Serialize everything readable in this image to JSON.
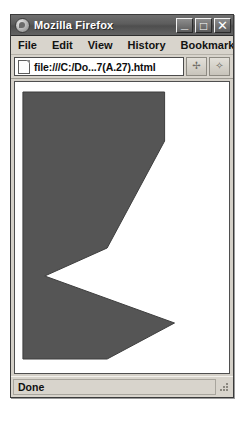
{
  "window": {
    "title": "Mozilla Firefox",
    "icon": "firefox-icon",
    "controls": {
      "minimize": "_",
      "maximize": "□",
      "close": "✕"
    }
  },
  "menubar": {
    "items": [
      {
        "label": "File",
        "accel": "F"
      },
      {
        "label": "Edit",
        "accel": "E"
      },
      {
        "label": "View",
        "accel": "V"
      },
      {
        "label": "History",
        "accel": "s"
      },
      {
        "label": "Bookmarks",
        "accel": "B"
      },
      {
        "label": "To",
        "accel": "T"
      }
    ]
  },
  "navbar": {
    "page_icon": "document-icon",
    "url": "file:///C:/Do...7(A.27).html",
    "url_placeholder": "Go to a Website",
    "buttons": [
      {
        "name": "go-button",
        "glyph": "✢"
      },
      {
        "name": "dropdown-button",
        "glyph": "✧"
      }
    ]
  },
  "statusbar": {
    "text": "Done",
    "grip": "resize-grip"
  },
  "chart_data": {
    "type": "polygon",
    "title": "",
    "background": "#ffffff",
    "fill": "#555555",
    "stroke": "#3d3d3d",
    "viewbox": [
      0,
      0,
      216,
      291
    ],
    "points": [
      [
        8,
        10
      ],
      [
        151,
        10
      ],
      [
        151,
        59
      ],
      [
        93,
        166
      ],
      [
        30,
        194
      ],
      [
        161,
        241
      ],
      [
        93,
        277
      ],
      [
        8,
        277
      ]
    ],
    "points_string": "8,10 151,10 151,59 93,166 30,194 161,241 93,277 8,277",
    "vertices_labeled": [
      {
        "name": "top-left",
        "x": 8,
        "y": 10
      },
      {
        "name": "top-right",
        "x": 151,
        "y": 10
      },
      {
        "name": "right-upper-tip",
        "x": 151,
        "y": 59
      },
      {
        "name": "mid-inflection",
        "x": 93,
        "y": 166
      },
      {
        "name": "notch-vertex",
        "x": 30,
        "y": 194
      },
      {
        "name": "right-lower-tip",
        "x": 161,
        "y": 241
      },
      {
        "name": "bottom-right",
        "x": 93,
        "y": 277
      },
      {
        "name": "bottom-left",
        "x": 8,
        "y": 277
      }
    ]
  }
}
